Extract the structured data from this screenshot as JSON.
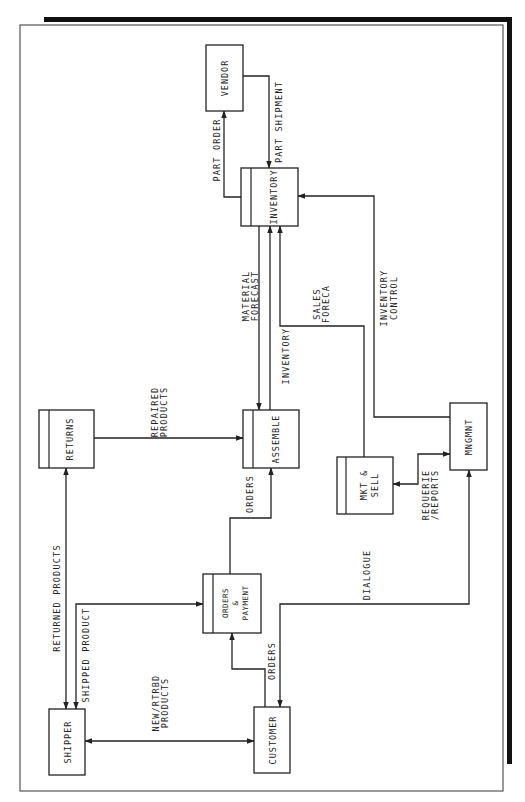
{
  "diagram": {
    "type": "data-flow-diagram",
    "orientation": "rotated-90-ccw",
    "entities": {
      "vendor": "VENDOR",
      "inventory": "INVENTORY",
      "assemble": "ASSEMBLE",
      "returns": "RETURNS",
      "mngmnt": "MNGMNT",
      "mkt_sell": [
        "MKT &",
        "SELL"
      ],
      "orders_payment": [
        "ORDERS",
        "&",
        "PAYMENT"
      ],
      "shipper": "SHIPPER",
      "customer": "CUSTOMER"
    },
    "flows": {
      "part_order": "PART ORDER",
      "part_shipment": "PART SHIPMENT",
      "material_forecast": [
        "MATERIAL",
        "FORECAST"
      ],
      "inventory": "INVENTORY",
      "sales_forecast": [
        "SALES",
        "FORECA"
      ],
      "inventory_control": [
        "INVENTORY",
        "CONTROL"
      ],
      "repaired_products": [
        "REPAIRED",
        "PRODUCTS"
      ],
      "orders_to_assemble": "ORDERS",
      "requeries_reports": [
        "REQUERIE",
        "/REPORTS"
      ],
      "returned_products": "RETURNED PRODUCTS",
      "shipped_product": "SHIPPED PRODUCT",
      "dialogue": "DIALOGUE",
      "new_rtrbd_products": [
        "NEW/RTRBD",
        "PRODUCTS"
      ],
      "orders_from_customer": "ORDERS"
    },
    "connections": [
      {
        "from": "INVENTORY",
        "to": "VENDOR",
        "label": "PART ORDER"
      },
      {
        "from": "VENDOR",
        "to": "INVENTORY",
        "label": "PART SHIPMENT"
      },
      {
        "from": "INVENTORY",
        "to": "ASSEMBLE",
        "label": "MATERIAL FORECAST"
      },
      {
        "from": "ASSEMBLE",
        "to": "INVENTORY",
        "label": "INVENTORY"
      },
      {
        "from": "MKT & SELL",
        "to": "INVENTORY",
        "label": "SALES FORECA"
      },
      {
        "from": "MNGMNT",
        "to": "INVENTORY",
        "label": "INVENTORY CONTROL"
      },
      {
        "from": "RETURNS",
        "to": "ASSEMBLE",
        "label": "REPAIRED PRODUCTS"
      },
      {
        "from": "ORDERS & PAYMENT",
        "to": "ASSEMBLE",
        "label": "ORDERS"
      },
      {
        "from": "MNGMNT",
        "to": "MKT & SELL",
        "label": "REQUERIE /REPORTS",
        "bidirectional": true
      },
      {
        "from": "SHIPPER",
        "to": "RETURNS",
        "label": "RETURNED PRODUCTS",
        "bidirectional": true
      },
      {
        "from": "ORDERS & PAYMENT",
        "to": "SHIPPER",
        "label": "SHIPPED PRODUCT",
        "bidirectional": true
      },
      {
        "from": "CUSTOMER",
        "to": "MNGMNT",
        "label": "DIALOGUE",
        "bidirectional": true
      },
      {
        "from": "SHIPPER",
        "to": "CUSTOMER",
        "label": "NEW/RTRBD PRODUCTS",
        "bidirectional": true
      },
      {
        "from": "CUSTOMER",
        "to": "ORDERS & PAYMENT",
        "label": "ORDERS"
      }
    ]
  }
}
